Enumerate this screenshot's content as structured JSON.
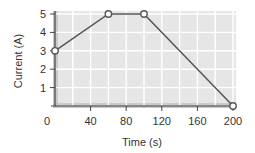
{
  "chart_data": {
    "type": "line",
    "title": "",
    "xlabel": "Time (s)",
    "ylabel": "Current (A)",
    "xlim": [
      0,
      200
    ],
    "ylim": [
      0,
      5
    ],
    "xticks": [
      0,
      40,
      80,
      120,
      160,
      200
    ],
    "yticks": [
      1,
      2,
      3,
      4,
      5
    ],
    "x_origin_label": "0",
    "grid": true,
    "x_grid_step": 20,
    "y_grid_step": 1,
    "legend": "none",
    "series": [
      {
        "name": "Current",
        "x": [
          0,
          60,
          100,
          200
        ],
        "values": [
          3,
          5,
          5,
          0
        ],
        "marker": "open-circle"
      }
    ]
  },
  "colors": {
    "plot_background": "#e6e6e6",
    "plot_shade": "#bdbdbd",
    "grid": "#ffffff",
    "axis": "#444444",
    "line": "#555555",
    "marker_fill": "#ffffff",
    "text": "#333333"
  }
}
